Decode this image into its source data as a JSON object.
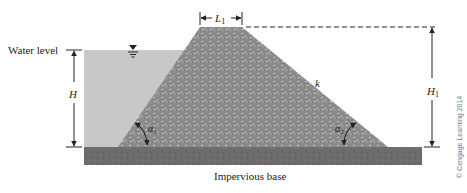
{
  "diagram": {
    "type": "earth-dam-cross-section",
    "labels": {
      "water_level": "Water level",
      "H": "H",
      "H1": "H",
      "H1_sub": "1",
      "L1": "L",
      "L1_sub": "1",
      "k": "k",
      "alpha1": "α",
      "alpha1_sub": "1",
      "alpha2": "α",
      "alpha2_sub": "2",
      "base": "Impervious base",
      "copyright": "© Cengage Learning 2014"
    },
    "colors": {
      "water": "#c8c8c8",
      "dam": "#8c8c8c",
      "base": "#6e6e6e",
      "line": "#222222"
    }
  }
}
